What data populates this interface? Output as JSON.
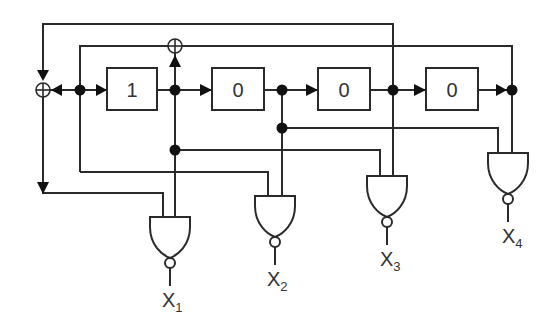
{
  "diagram": {
    "type": "LFSR circuit with NAND output decoders",
    "registers": [
      {
        "id": "r1",
        "value": "1"
      },
      {
        "id": "r2",
        "value": "0"
      },
      {
        "id": "r3",
        "value": "0"
      },
      {
        "id": "r4",
        "value": "0"
      }
    ],
    "xor_gates": [
      {
        "id": "xor-feedback",
        "position": "left of register chain"
      },
      {
        "id": "xor-tap",
        "position": "above node after register 1"
      }
    ],
    "outputs": [
      {
        "id": "x1",
        "base": "X",
        "sub": "1"
      },
      {
        "id": "x2",
        "base": "X",
        "sub": "2"
      },
      {
        "id": "x3",
        "base": "X",
        "sub": "3"
      },
      {
        "id": "x4",
        "base": "X",
        "sub": "4"
      }
    ],
    "colors": {
      "line": "#2a2a2a",
      "node": "#111111",
      "background": "#ffffff"
    }
  }
}
